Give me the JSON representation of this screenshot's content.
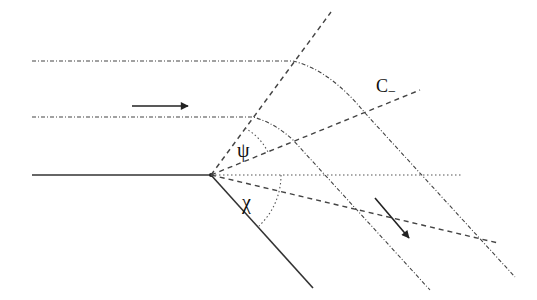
{
  "diagram": {
    "labels": {
      "characteristic": "C_",
      "characteristic_main": "C",
      "characteristic_sub": "−",
      "angle_psi": "ψ",
      "angle_chi": "χ"
    },
    "colors": {
      "line": "#222222",
      "dashed": "#444444",
      "dotted": "#555555",
      "background": "#ffffff"
    },
    "elements": [
      {
        "type": "wall-upstream",
        "style": "solid"
      },
      {
        "type": "wall-downstream",
        "style": "solid"
      },
      {
        "type": "streamline-upper",
        "style": "dash-dot"
      },
      {
        "type": "streamline-lower",
        "style": "dash-dot"
      },
      {
        "type": "mach-line-leading",
        "style": "dashed"
      },
      {
        "type": "characteristic-c-minus",
        "style": "dashed"
      },
      {
        "type": "mach-line-trailing",
        "style": "dashed"
      },
      {
        "type": "horizontal-reference",
        "style": "dotted"
      },
      {
        "type": "flow-arrow-incoming",
        "style": "solid-arrow"
      },
      {
        "type": "flow-arrow-outgoing",
        "style": "solid-arrow"
      },
      {
        "type": "angle-arc-psi",
        "style": "dotted"
      },
      {
        "type": "angle-arc-chi",
        "style": "dotted"
      }
    ]
  }
}
